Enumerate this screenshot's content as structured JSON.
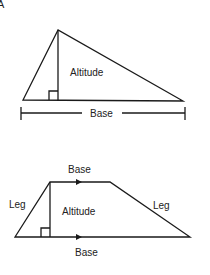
{
  "corner_glyph": "A",
  "triangle": {
    "altitude_label": "Altitude",
    "base_label": "Base",
    "right_angle_marker": true
  },
  "trapezoid": {
    "top_base_label": "Base",
    "bottom_base_label": "Base",
    "left_leg_label": "Leg",
    "right_leg_label": "Leg",
    "altitude_label": "Altitude",
    "parallel_arrows": true,
    "right_angle_marker": true
  },
  "colors": {
    "stroke": "#1a1a1a",
    "text": "#222222",
    "background": "#ffffff"
  }
}
